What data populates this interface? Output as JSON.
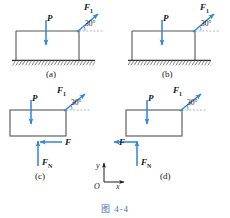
{
  "figure": {
    "caption": "图 4-4",
    "caption_color": "#4a6fb5",
    "block_line_color": "#555555",
    "arrow_color": "#2e86d8",
    "ground_color": "#333333"
  },
  "panels": [
    {
      "id": "a",
      "label": "(a)",
      "has_ground": true,
      "forces": [
        {
          "name": "P",
          "symbol": "P",
          "sub": "",
          "direction": "down"
        },
        {
          "name": "F1",
          "symbol": "F",
          "sub": "1",
          "direction": "up-right-30"
        }
      ],
      "angle": "30°"
    },
    {
      "id": "b",
      "label": "(b)",
      "has_ground": true,
      "forces": [
        {
          "name": "P",
          "symbol": "P",
          "sub": "",
          "direction": "down"
        },
        {
          "name": "F1",
          "symbol": "F",
          "sub": "1",
          "direction": "up-right-30"
        }
      ],
      "angle": "30°"
    },
    {
      "id": "c",
      "label": "(c)",
      "has_ground": false,
      "forces": [
        {
          "name": "P",
          "symbol": "P",
          "sub": "",
          "direction": "down"
        },
        {
          "name": "F1",
          "symbol": "F",
          "sub": "1",
          "direction": "up-right-30"
        },
        {
          "name": "F",
          "symbol": "F",
          "sub": "",
          "direction": "left"
        },
        {
          "name": "FN",
          "symbol": "F",
          "sub": "N",
          "direction": "up"
        }
      ],
      "angle": "30°"
    },
    {
      "id": "d",
      "label": "(d)",
      "has_ground": false,
      "forces": [
        {
          "name": "P",
          "symbol": "P",
          "sub": "",
          "direction": "down"
        },
        {
          "name": "F1",
          "symbol": "F",
          "sub": "1",
          "direction": "up-right-30"
        },
        {
          "name": "F",
          "symbol": "F",
          "sub": "",
          "direction": "left"
        },
        {
          "name": "FN",
          "symbol": "F",
          "sub": "N",
          "direction": "up"
        }
      ],
      "angle": "30°"
    }
  ],
  "axes": {
    "origin_label": "O",
    "x_label": "x",
    "y_label": "y"
  },
  "labels": {
    "P": "P",
    "F": "F",
    "F_symbol": "F",
    "sub_1": "1",
    "sub_N": "N",
    "angle_30": "30°",
    "panel_a": "(a)",
    "panel_b": "(b)",
    "panel_c": "(c)",
    "panel_d": "(d)",
    "axis_x": "x",
    "axis_y": "y",
    "axis_o": "O",
    "caption": "图 4-4"
  }
}
